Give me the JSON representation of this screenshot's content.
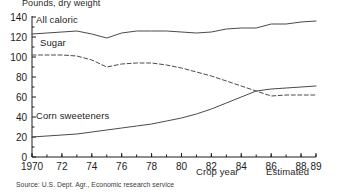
{
  "figure": {
    "units_label": "Pounds, dry weight",
    "source_note": "Source: U.S. Dept. Agr., Economic research service",
    "estimated_label": "Estimated"
  },
  "chart_data": {
    "type": "line",
    "title": "Pounds, dry weight",
    "xlabel": "Crop year",
    "ylabel": "Pounds, dry weight",
    "xlim": [
      1970,
      1989
    ],
    "ylim": [
      0,
      140
    ],
    "ytick_step": 20,
    "yticks": [
      0,
      20,
      40,
      60,
      80,
      100,
      120,
      140
    ],
    "ytick_labels": [
      "0",
      "20",
      "40",
      "60",
      "80",
      "100",
      "120",
      "140"
    ],
    "xticks": [
      1970,
      1972,
      1974,
      1976,
      1978,
      1980,
      1982,
      1984,
      1986,
      1988,
      1989
    ],
    "xtick_labels": [
      "1970",
      "72",
      "74",
      "76",
      "78",
      "80",
      "82",
      "84",
      "86",
      "88",
      "89"
    ],
    "xminor_step": 1,
    "grid": false,
    "legend_position": "inline-labels",
    "annotations": [
      "Estimated"
    ],
    "x": [
      1970,
      1971,
      1972,
      1973,
      1974,
      1975,
      1976,
      1977,
      1978,
      1979,
      1980,
      1981,
      1982,
      1983,
      1984,
      1985,
      1986,
      1987,
      1988,
      1989
    ],
    "series": [
      {
        "name": "All caloric",
        "style": "solid",
        "color": "#4a4a4a",
        "values": [
          123,
          124,
          125,
          126,
          123,
          119,
          124,
          126,
          126,
          126,
          125,
          124,
          125,
          128,
          129,
          129,
          133,
          133,
          135,
          136
        ]
      },
      {
        "name": "Sugar",
        "style": "dashed",
        "color": "#4a4a4a",
        "values": [
          102,
          102,
          102,
          101,
          97,
          90,
          93,
          94,
          94,
          92,
          89,
          85,
          81,
          76,
          71,
          66,
          61,
          62,
          62,
          62
        ]
      },
      {
        "name": "Corn sweeteners",
        "style": "solid",
        "color": "#4a4a4a",
        "values": [
          20,
          21,
          22,
          23,
          25,
          27,
          29,
          31,
          33,
          36,
          39,
          43,
          48,
          54,
          60,
          66,
          68,
          69,
          70,
          71
        ]
      }
    ]
  }
}
